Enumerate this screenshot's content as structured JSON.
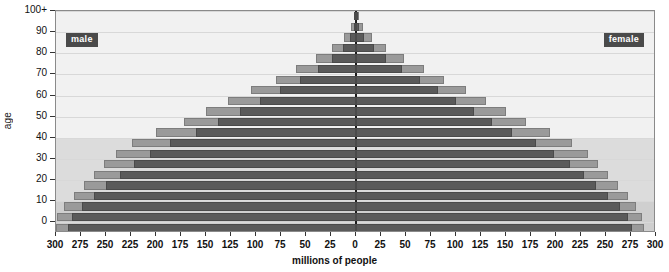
{
  "chart_data": {
    "type": "bar",
    "subtype": "population-pyramid",
    "title": "",
    "xlabel": "millions of people",
    "ylabel": "age",
    "legend": [
      {
        "key": "male",
        "label": "male",
        "position": "top-left",
        "color": "#4a4a4a"
      },
      {
        "key": "female",
        "label": "female",
        "position": "top-right",
        "color": "#4a4a4a"
      }
    ],
    "grid": true,
    "xlim": [
      -300,
      300
    ],
    "ylim_categories": 21,
    "x_tick_labels_left": [
      "300",
      "275",
      "250",
      "225",
      "200",
      "175",
      "150",
      "125",
      "100",
      "75",
      "50",
      "25"
    ],
    "x_tick_labels_right": [
      "0",
      "25",
      "50",
      "75",
      "100",
      "125",
      "150",
      "175",
      "200",
      "225",
      "250",
      "275",
      "300"
    ],
    "x_tick_values": [
      -300,
      -275,
      -250,
      -225,
      -200,
      -175,
      -150,
      -125,
      -100,
      -75,
      -50,
      -25,
      0,
      25,
      50,
      75,
      100,
      125,
      150,
      175,
      200,
      225,
      250,
      275,
      300
    ],
    "y_tick_labels": [
      "0",
      "10",
      "20",
      "30",
      "40",
      "50",
      "60",
      "70",
      "80",
      "90",
      "100+"
    ],
    "y_tick_values": [
      0,
      10,
      20,
      30,
      40,
      50,
      60,
      70,
      80,
      90,
      100
    ],
    "categories": [
      "0",
      "5",
      "10",
      "15",
      "20",
      "25",
      "30",
      "35",
      "40",
      "45",
      "50",
      "55",
      "60",
      "65",
      "70",
      "75",
      "80",
      "85",
      "90",
      "95",
      "100+"
    ],
    "series": [
      {
        "name": "male-outer",
        "side": "left",
        "layer": "outer",
        "color": "#9a9a9a",
        "values": [
          300,
          299,
          292,
          282,
          272,
          262,
          252,
          240,
          224,
          200,
          172,
          150,
          128,
          105,
          80,
          60,
          40,
          24,
          12,
          5,
          2
        ]
      },
      {
        "name": "male-inner",
        "side": "left",
        "layer": "inner",
        "color": "#5a5a5a",
        "values": [
          288,
          284,
          274,
          262,
          250,
          236,
          222,
          206,
          186,
          160,
          138,
          116,
          96,
          76,
          56,
          38,
          24,
          13,
          6,
          2,
          1
        ]
      },
      {
        "name": "female-outer",
        "side": "right",
        "layer": "outer",
        "color": "#9a9a9a",
        "values": [
          288,
          286,
          280,
          272,
          262,
          252,
          242,
          232,
          216,
          194,
          170,
          150,
          130,
          110,
          88,
          68,
          48,
          30,
          16,
          7,
          3
        ]
      },
      {
        "name": "female-inner",
        "side": "right",
        "layer": "inner",
        "color": "#5a5a5a",
        "values": [
          276,
          272,
          264,
          252,
          240,
          228,
          214,
          198,
          180,
          156,
          136,
          118,
          100,
          82,
          64,
          46,
          30,
          18,
          8,
          3,
          1
        ]
      }
    ],
    "bands": [
      {
        "from_category_index": 3,
        "to_category_index": 9,
        "color": "#dcdcdc"
      },
      {
        "from_category_index": 0,
        "to_category_index": 3,
        "color": "#cfcfcf"
      }
    ]
  }
}
